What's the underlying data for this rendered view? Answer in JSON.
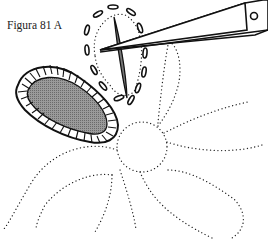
{
  "figure": {
    "caption": "Figura 81 A",
    "elements": [
      "filled-petal-with-buttonhole-edge",
      "petal-with-running-stitch-outline",
      "needle",
      "scissors-blade",
      "dotted-flower-pattern"
    ]
  },
  "colors": {
    "ink": "#111111",
    "fill": "#8a8a8a",
    "background": "#ffffff"
  }
}
